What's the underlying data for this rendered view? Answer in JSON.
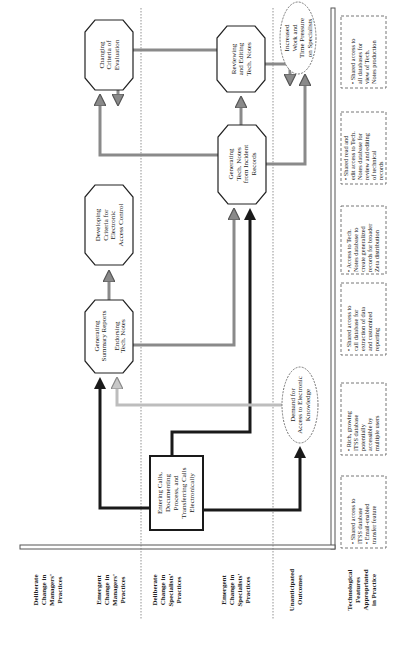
{
  "lanes": [
    {
      "id": "deliberate-managers",
      "lines": [
        "Deliberate",
        "Change in",
        "Managers'",
        "Practices"
      ]
    },
    {
      "id": "emergent-managers",
      "lines": [
        "Emergent",
        "Change in",
        "Managers'",
        "Practices"
      ]
    },
    {
      "id": "deliberate-specialists",
      "lines": [
        "Deliberate",
        "Change in",
        "Specialists'",
        "Practices"
      ]
    },
    {
      "id": "emergent-specialists",
      "lines": [
        "Emergent",
        "Change in",
        "Specialists'",
        "Practices"
      ]
    },
    {
      "id": "unanticipated",
      "lines": [
        "Unanticipated",
        "Outcomes"
      ]
    },
    {
      "id": "tech-features",
      "lines": [
        "Technological",
        "Features",
        "Appropriated",
        "in Practice"
      ]
    }
  ],
  "nodes": {
    "changing_criteria": {
      "lines": [
        "Changing",
        "Criteria of",
        "Evaluation"
      ]
    },
    "developing_criteria": {
      "lines": [
        "Developing",
        "Criteria for",
        "Electronic",
        "Access Control"
      ]
    },
    "summary_reports": {
      "lines": [
        "Generating",
        "Summary Reports",
        "",
        "Endorsing",
        "Tech. Notes"
      ]
    },
    "generating_tech_notes": {
      "lines": [
        "Generating",
        "Tech. Notes",
        "from Incident",
        "Records"
      ]
    },
    "reviewing_tech_notes": {
      "lines": [
        "Reviewing",
        "and Editing",
        "Tech. Notes"
      ]
    },
    "increased_work": {
      "lines": [
        "Increased",
        "Work and",
        "Time Pressure",
        "on Specialists"
      ]
    },
    "demand_access": {
      "lines": [
        "Demand for",
        "Access to Electronic",
        "Knowledge"
      ]
    },
    "entering_calls": {
      "lines": [
        "Entering Calls,",
        "Documenting",
        "Process, and",
        "Transferring Calls",
        "Electronically"
      ]
    }
  },
  "features": [
    {
      "lines": [
        "• Shared access to",
        "  ITSS database",
        "• Email-enabled",
        "  transfer feature"
      ]
    },
    {
      "lines": [
        "• Rich, growing",
        "  ITSS database",
        "  potentially",
        "  accessible by",
        "  multiple users"
      ]
    },
    {
      "lines": [
        "• Shared access to",
        "  call database for",
        "  extraction of data",
        "  and customized",
        "  reporting"
      ]
    },
    {
      "lines": [
        "• Access to Tech.",
        "  Notes database to",
        "  create generalized",
        "  records for broader",
        "  Zeta distribution"
      ]
    },
    {
      "lines": [
        "• Shared read and",
        "  edit access to Tech.",
        "  Notes database for",
        "  review and editing",
        "  of technical",
        "  records"
      ]
    },
    {
      "lines": [
        "• Shared access to",
        "  all databases for",
        "  view of Tech.",
        "  Notes production"
      ]
    }
  ],
  "legend": {
    "deliberate_arrow": "black solid",
    "emergent_arrow": "gray hatched"
  },
  "colors": {
    "ink": "#1a1a1a",
    "hatched": "#8a8a8a",
    "light_hatched": "#b8b8b8",
    "frame": "#555555"
  }
}
